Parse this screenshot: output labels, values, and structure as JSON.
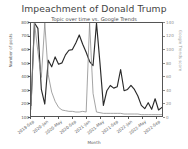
{
  "chart_data": {
    "type": "line",
    "title": "Impeachment of Donald Trump",
    "subtitle": "Topic over time vs. Google Trends",
    "xlabel": "Month",
    "ylabel": "Number of posts",
    "ylabel_right": "Google Trends score",
    "grid": false,
    "legend": "none",
    "ylim": [
      100,
      800
    ],
    "ylim_right": [
      0,
      140
    ],
    "yticks": [
      800,
      700,
      600,
      500,
      400,
      300,
      200,
      100
    ],
    "yticks_right": [
      140,
      120,
      100,
      80,
      60,
      40,
      20,
      0
    ],
    "categories": [
      "2019-Sep",
      "2019-Oct",
      "2019-Nov",
      "2019-Dec",
      "2020-Jan",
      "2020-Feb",
      "2020-Mar",
      "2020-Apr",
      "2020-May",
      "2020-Jun",
      "2020-Jul",
      "2020-Aug",
      "2020-Sep",
      "2020-Oct",
      "2020-Nov",
      "2020-Dec",
      "2021-Jan",
      "2021-Feb",
      "2021-Mar",
      "2021-Apr",
      "2021-May",
      "2021-Jun",
      "2021-Jul",
      "2021-Aug",
      "2021-Sep",
      "2021-Oct",
      "2021-Nov",
      "2021-Dec",
      "2022-Jan",
      "2022-Feb",
      "2022-Mar",
      "2022-Apr",
      "2022-May",
      "2022-Jun",
      "2022-Jul",
      "2022-Aug",
      "2022-Sep",
      "2022-Oct",
      "2022-Nov"
    ],
    "xticks": [
      "2019-Sep",
      "2020-Jan",
      "2020-May",
      "2020-Sep",
      "2021-Jan",
      "2021-May",
      "2021-Sep",
      "2022-Jan",
      "2022-May",
      "2022-Sep"
    ],
    "series": [
      {
        "name": "Number of posts",
        "axis": "left",
        "color": "#2a2a2a",
        "values": [
          180,
          800,
          760,
          300,
          190,
          520,
          470,
          545,
          490,
          500,
          560,
          595,
          600,
          650,
          710,
          640,
          580,
          510,
          480,
          800,
          500,
          180,
          290,
          330,
          310,
          320,
          450,
          290,
          300,
          330,
          300,
          250,
          180,
          155,
          200,
          150,
          230,
          145,
          165
        ]
      },
      {
        "name": "Google Trends score",
        "axis": "right",
        "color": "#8d8d8d",
        "values": [
          10,
          140,
          97,
          58,
          140,
          62,
          36,
          22,
          13,
          9,
          8,
          7,
          7,
          6,
          6,
          7,
          6,
          140,
          34,
          6,
          5,
          4,
          4,
          4,
          4,
          4,
          4,
          3,
          3,
          3,
          3,
          3,
          2,
          2,
          2,
          2,
          2,
          2,
          2
        ]
      }
    ]
  }
}
